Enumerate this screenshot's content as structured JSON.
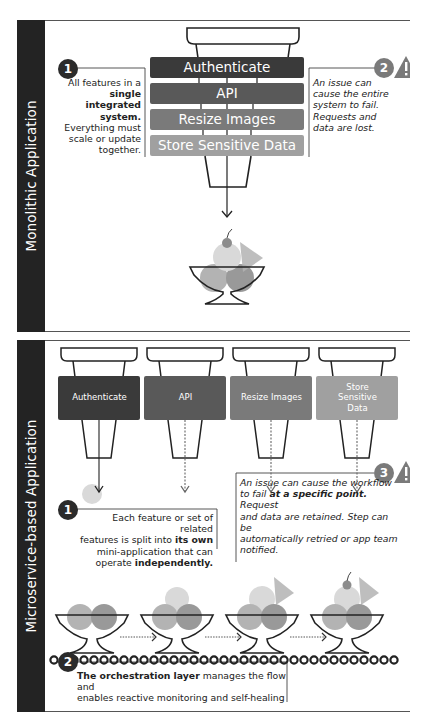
{
  "monolithic": {
    "section_label": "Monolithic Application",
    "layers": [
      {
        "label": "Authenticate",
        "color": "#3a3a3a"
      },
      {
        "label": "API",
        "color": "#595959"
      },
      {
        "label": "Resize Images",
        "color": "#7a7a7a"
      },
      {
        "label": "Store Sensitive Data",
        "color": "#a0a0a0"
      }
    ],
    "callout_1": {
      "number": "1",
      "line1": "All features in a",
      "line2_bold": "single integrated",
      "line3_bold": "system.",
      "line4": "Everything must",
      "line5": "scale or update",
      "line6": "together."
    },
    "callout_2": {
      "number": "2",
      "icon": "warning-icon",
      "lines": [
        "An issue can",
        "cause the entire",
        "system to fail.",
        "Requests and",
        "data are lost."
      ]
    }
  },
  "microservice": {
    "section_label": "Microservice-based Application",
    "services": [
      {
        "label": "Authenticate",
        "color": "#3a3a3a"
      },
      {
        "label": "API",
        "color": "#595959"
      },
      {
        "label": "Resize Images",
        "color": "#7a7a7a"
      },
      {
        "label": "Store Sensitive Data",
        "color": "#a0a0a0"
      }
    ],
    "callout_1": {
      "number": "1",
      "line1": "Each feature or set of related",
      "line2_pre": "features is split into ",
      "line2_bold": "its own",
      "line3": "mini-application that can",
      "line4_pre": "operate ",
      "line4_bold": "independently."
    },
    "callout_2": {
      "number": "2",
      "line1_bold": "The orchestration layer",
      "line1_rest": " manages the flow and",
      "line2": "enables reactive monitoring and self-healing"
    },
    "callout_3": {
      "number": "3",
      "icon": "warning-icon",
      "line1": "An issue can cause the workflow",
      "line2_pre": "to fail ",
      "line2_bold": "at a specific point.",
      "line2_rest": " Request",
      "line3": "and data are retained. Step can be",
      "line4": "automatically retried or app team",
      "line5": "notified."
    }
  },
  "colors": {
    "sidebar": "#232323",
    "badge_dark": "#2b2b2b",
    "badge_mid": "#7a7a7a",
    "scoop_light": "#d9d9d9",
    "scoop_mid": "#b3b3b3",
    "scoop_dark": "#999999",
    "cherry": "#8c8c8c"
  }
}
